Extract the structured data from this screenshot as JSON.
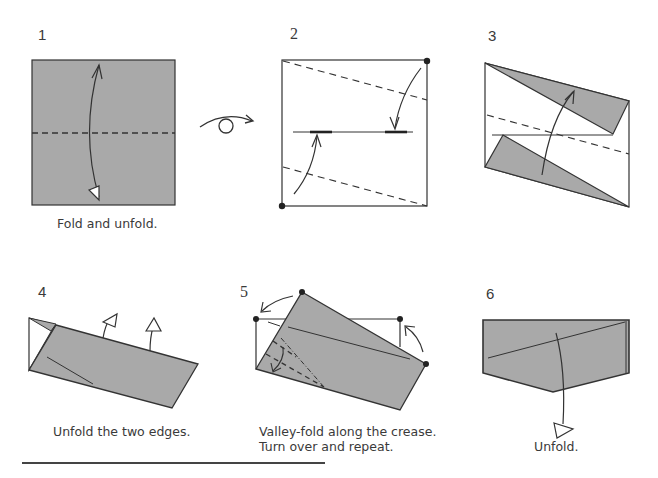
{
  "colors": {
    "paper_gray": "#a9a9a9",
    "line": "#333333",
    "background": "#ffffff"
  },
  "steps": [
    {
      "number": "1",
      "caption": "Fold and unfold."
    },
    {
      "number": "2",
      "caption": ""
    },
    {
      "number": "3",
      "caption": ""
    },
    {
      "number": "4",
      "caption": "Unfold the two edges."
    },
    {
      "number": "5",
      "caption_line1": "Valley-fold along the crease.",
      "caption_line2": "Turn over and repeat."
    },
    {
      "number": "6",
      "caption": "Unfold."
    }
  ],
  "symbols": {
    "turn_over": "turn-over-icon"
  }
}
